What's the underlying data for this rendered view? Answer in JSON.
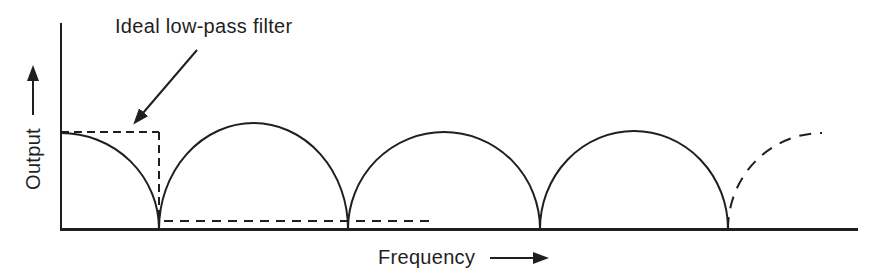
{
  "figure": {
    "background": "#ffffff",
    "ink_color": "#1f1f1f",
    "annotation_label": "Ideal low-pass filter",
    "x_axis_label": "Frequency",
    "y_axis_label": "Output"
  },
  "chart_data": {
    "type": "line",
    "xlabel": "Frequency",
    "ylabel": "Output",
    "x_tick_labels": [],
    "y_tick_labels": [],
    "grid": false,
    "legend": null,
    "series": [
      {
        "name": "comb filter response",
        "line_style": "solid, final rising lobe dashed",
        "description": "Starts at maximum output at zero frequency, falls to a null at the cutoff, then repeats arch-shaped lobes with cusped nulls at regular frequency intervals; the last rising lobe is drawn dashed to show continuation",
        "normalized_points": [
          [
            0,
            1
          ],
          [
            0.5,
            0
          ],
          [
            1,
            1
          ],
          [
            1.5,
            0
          ],
          [
            2,
            1
          ],
          [
            2.5,
            0
          ],
          [
            3,
            1
          ],
          [
            3.5,
            0
          ],
          [
            4,
            0.97
          ]
        ]
      },
      {
        "name": "ideal low-pass filter",
        "line_style": "dashed",
        "description": "Rectangular response: constant unity output up to the first null (cutoff), zero output beyond",
        "normalized_points": [
          [
            0,
            1
          ],
          [
            0.5,
            1
          ],
          [
            0.5,
            0
          ],
          [
            1.45,
            0
          ]
        ]
      }
    ],
    "geometry_px": {
      "canvas": {
        "width": 877,
        "height": 280
      },
      "axis_origin": {
        "x": 61,
        "y": 229
      },
      "y_axis_top": 23,
      "x_axis_right": 858,
      "curve_start_y": 133,
      "nulls_x": [
        159,
        348,
        540,
        728
      ],
      "arch_peak_y": [
        123,
        132,
        131
      ],
      "dashed_arch_end": {
        "x": 822,
        "y": 133
      },
      "ideal_filter": {
        "top_y": 132,
        "cutoff_x": 159,
        "stop_y": 221,
        "stop_start_x": 164,
        "stop_end_x": 434
      },
      "annotation_arrow": {
        "x1": 197,
        "y1": 50,
        "x2": 143,
        "y2": 113
      },
      "y_axis_arrow": {
        "x": 33,
        "y1": 115,
        "y2": 80
      },
      "x_axis_arrow": {
        "y": 258,
        "x1": 490,
        "x2": 534
      },
      "stroke": {
        "curve_width": 2,
        "y_axis_width": 2,
        "x_axis_width": 3,
        "dash_rect": "8 5",
        "dash_stop": "9 7",
        "dash_arch": "12 9"
      }
    }
  }
}
